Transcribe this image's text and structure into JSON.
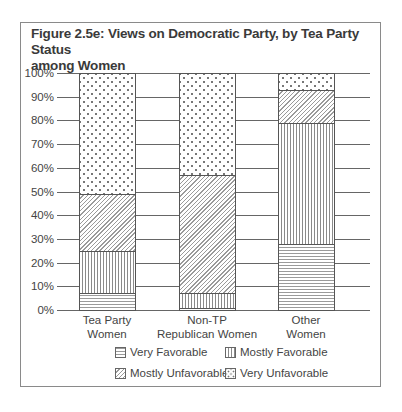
{
  "figure": {
    "title_line1": "Figure 2.5e: Views on Democratic Party, by Tea Party Status",
    "title_line2": "among Women"
  },
  "chart_data": {
    "type": "bar",
    "stacked": true,
    "percent": true,
    "title": "Figure 2.5e: Views on Democratic Party, by Tea Party Status among Women",
    "xlabel": "",
    "ylabel": "",
    "ylim": [
      0,
      100
    ],
    "yticks": [
      "0%",
      "10%",
      "20%",
      "30%",
      "40%",
      "50%",
      "60%",
      "70%",
      "80%",
      "90%",
      "100%"
    ],
    "grid": true,
    "legend_position": "bottom",
    "categories": [
      [
        "Tea Party",
        "Women"
      ],
      [
        "Non-TP",
        "Republican Women"
      ],
      [
        "Other",
        "Women"
      ]
    ],
    "series": [
      {
        "name": "Very Favorable",
        "pattern": "horizontal-lines",
        "values": [
          7,
          1,
          28
        ]
      },
      {
        "name": "Mostly Favorable",
        "pattern": "vertical-lines",
        "values": [
          18,
          6,
          51
        ]
      },
      {
        "name": "Mostly Unfavorable",
        "pattern": "diagonal-lines",
        "values": [
          24,
          50,
          14
        ]
      },
      {
        "name": "Very Unfavorable",
        "pattern": "dots",
        "values": [
          51,
          43,
          7
        ]
      }
    ]
  },
  "legend": {
    "very_favorable": "Very Favorable",
    "mostly_favorable": "Mostly Favorable",
    "mostly_unfavorable": "Mostly Unfavorable",
    "very_unfavorable": "Very Unfavorable"
  }
}
